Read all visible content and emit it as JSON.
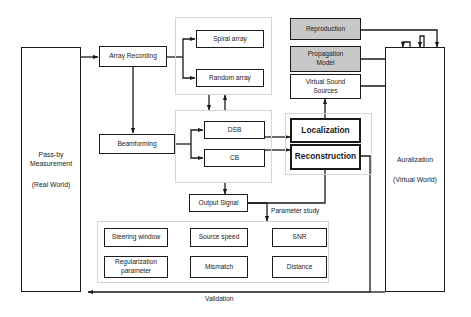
{
  "diagram": {
    "colors": {
      "box_border": "#1a1a1a",
      "box_fill": "#ffffff",
      "gray_fill": "#c8c8c8",
      "group_border": "#d4d4d4",
      "line": "#1a1a1a",
      "background": "#ffffff"
    },
    "nodes": {
      "passby": {
        "line1": "Pass-by",
        "line2": "Measurement",
        "line3": "(Real World)"
      },
      "array_recording": {
        "label": "Array Recording"
      },
      "spiral_array": {
        "label": "Spiral array"
      },
      "random_array": {
        "label": "Random array"
      },
      "beamforming": {
        "label": "Beamforming"
      },
      "dsb": {
        "label": "DSB"
      },
      "cb": {
        "label": "CB"
      },
      "output_signal": {
        "label": "Output Signal"
      },
      "localization": {
        "label": "Localization"
      },
      "reconstruction": {
        "label": "Reconstruction"
      },
      "reproduction": {
        "label": "Reproduction"
      },
      "propagation_model": {
        "line1": "Propagation",
        "line2": "Model"
      },
      "virtual_sound_sources": {
        "line1": "Virtual Sound",
        "line2": "Sources"
      },
      "auralization": {
        "line1": "Auralization",
        "line2": "(Virtual World)"
      },
      "steering_window": {
        "label": "Steering window"
      },
      "source_speed": {
        "label": "Source speed"
      },
      "snr": {
        "label": "SNR"
      },
      "regularization_parameter": {
        "line1": "Regularization",
        "line2": "parameter"
      },
      "mismatch": {
        "label": "Mismatch"
      },
      "distance": {
        "label": "Distance"
      }
    },
    "edge_labels": {
      "parameter_study": "Parameter study",
      "validation": "Validation"
    }
  }
}
